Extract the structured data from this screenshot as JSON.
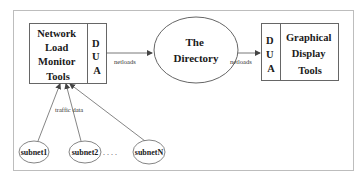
{
  "diagram": {
    "left_box": {
      "title_lines": [
        "Network",
        "Load",
        "Monitor",
        "Tools"
      ],
      "dua_letters": [
        "D",
        "U",
        "A"
      ]
    },
    "directory": {
      "title_lines": [
        "The",
        "Directory"
      ]
    },
    "right_box": {
      "title_lines": [
        "Graphical",
        "Display",
        "Tools"
      ],
      "dua_letters": [
        "D",
        "U",
        "A"
      ]
    },
    "edges": {
      "left_to_directory_label": "netloads",
      "directory_to_right_label": "netloads",
      "subnets_to_left_label": "traffic data"
    },
    "subnets": [
      {
        "label": "subnet1"
      },
      {
        "label": "subnet2"
      },
      {
        "label": "subnetN"
      }
    ],
    "ellipsis": ". . . ."
  },
  "colors": {
    "stroke": "#555555",
    "frame": "#bbbbbb",
    "text": "#1a1a1a"
  }
}
